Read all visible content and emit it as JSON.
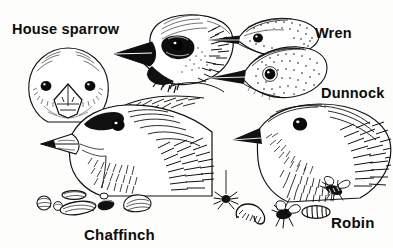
{
  "plate": {
    "title": "Garden bird head profiles",
    "medium": "black and white engraved line illustration",
    "background_color": "#fdfdfb",
    "ink_color": "#111111",
    "width": 393,
    "height": 248
  },
  "labels": {
    "house_sparrow": "House sparrow",
    "wren": "Wren",
    "dunnock": "Dunnock",
    "chaffinch": "Chaffinch",
    "robin": "Robin"
  },
  "subjects": [
    {
      "name": "house-sparrow-front",
      "common_name": "House sparrow",
      "view": "front-facing head",
      "beak": "conical seed-eating bill",
      "label_ref": "house_sparrow"
    },
    {
      "name": "house-sparrow-profile",
      "common_name": "House sparrow",
      "view": "left-facing head profile",
      "beak": "heavy conical black bill",
      "label_ref": "house_sparrow"
    },
    {
      "name": "wren-profile",
      "common_name": "Wren",
      "view": "left-facing head profile",
      "beak": "fine slender pointed bill",
      "label_ref": "wren"
    },
    {
      "name": "dunnock-profile",
      "common_name": "Dunnock",
      "view": "left-facing head profile",
      "beak": "thin pointed insect-eating bill",
      "label_ref": "dunnock"
    },
    {
      "name": "chaffinch-profile",
      "common_name": "Chaffinch",
      "view": "left-facing head profile",
      "beak": "stout conical bill",
      "label_ref": "chaffinch"
    },
    {
      "name": "robin-profile",
      "common_name": "Robin",
      "view": "left-facing head profile",
      "beak": "fine pointed bill",
      "label_ref": "robin"
    }
  ],
  "food_items": {
    "chaffinch_food_caption": "seeds",
    "chaffinch_foods": [
      "round seed",
      "small round seed",
      "flat oval seed",
      "large husked seed",
      "dark seed",
      "split shell"
    ],
    "robin_food_caption": "invertebrates",
    "robin_foods": [
      "spider on silk thread",
      "caterpillar",
      "fly",
      "grub",
      "wasp"
    ]
  }
}
